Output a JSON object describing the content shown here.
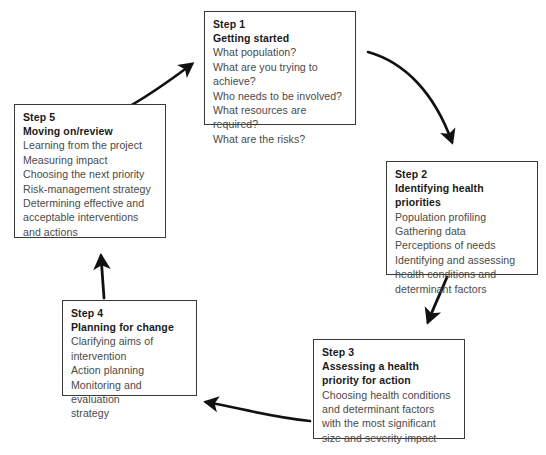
{
  "diagram": {
    "accent_color": "#1a1a1a",
    "body_text_color": "#4a4a4a",
    "border_color": "#3a3a3a",
    "background_color": "#ffffff",
    "steps": [
      {
        "id": "step1",
        "number": "Step 1",
        "title": "Getting started",
        "lines": [
          "What population?",
          "What are you trying to",
          "achieve?",
          "Who needs to be involved?",
          "What resources are required?",
          "What are the risks?"
        ]
      },
      {
        "id": "step2",
        "number": "Step 2",
        "title": "Identifying health priorities",
        "lines": [
          "Population profiling",
          "Gathering data",
          "Perceptions of needs",
          "Identifying and assessing",
          "health conditions and",
          "determinant factors"
        ]
      },
      {
        "id": "step3",
        "number": "Step 3",
        "title": "Assessing a health priority for action",
        "lines": [
          "Choosing health conditions",
          "and determinant factors",
          "with the most significant",
          "size and severity impact"
        ]
      },
      {
        "id": "step4",
        "number": "Step 4",
        "title": "Planning for change",
        "lines": [
          "Clarifying aims of",
          "intervention",
          "Action planning",
          "Monitoring and evaluation",
          "strategy"
        ]
      },
      {
        "id": "step5",
        "number": "Step 5",
        "title": "Moving on/review",
        "lines": [
          "Learning from the project",
          "Measuring impact",
          "Choosing the next priority",
          "Risk-management strategy",
          "Determining effective and",
          "acceptable interventions",
          "and actions"
        ]
      }
    ],
    "arrows": [
      {
        "id": "arrow-1-to-2",
        "from": "step1",
        "to": "step2",
        "direction": "curve-down-right"
      },
      {
        "id": "arrow-2-to-3",
        "from": "step2",
        "to": "step3",
        "direction": "curve-down-left"
      },
      {
        "id": "arrow-3-to-4",
        "from": "step3",
        "to": "step4",
        "direction": "curve-left"
      },
      {
        "id": "arrow-4-to-5",
        "from": "step4",
        "to": "step5",
        "direction": "up"
      },
      {
        "id": "arrow-5-to-1",
        "from": "step5",
        "to": "step1",
        "direction": "curve-up-right"
      }
    ]
  }
}
